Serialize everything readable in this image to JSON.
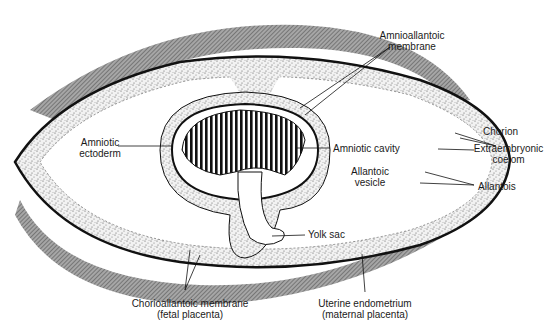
{
  "diagram": {
    "colors": {
      "uterine_wall": "#8a8a8a",
      "stipple": "#d8d8d8",
      "outline": "#111111",
      "background": "#ffffff"
    },
    "labels": {
      "amnioallantoic_l1": "Amnioallantoic",
      "amnioallantoic_l2": "membrane",
      "chorion": "Chorion",
      "extraembryonic_l1": "Extraembryonic",
      "extraembryonic_l2": "coelom",
      "allantois": "Allantois",
      "amniotic_ectoderm_l1": "Amniotic",
      "amniotic_ectoderm_l2": "ectoderm",
      "amniotic_cavity": "Amniotic cavity",
      "allantoic_vesicle_l1": "Allantoic",
      "allantoic_vesicle_l2": "vesicle",
      "yolk_sac": "Yolk sac",
      "chorioallantoic_l1": "Chorioallantoic membrane",
      "chorioallantoic_l2": "(fetal placenta)",
      "uterine_l1": "Uterine endometrium",
      "uterine_l2": "(maternal placenta)"
    }
  }
}
